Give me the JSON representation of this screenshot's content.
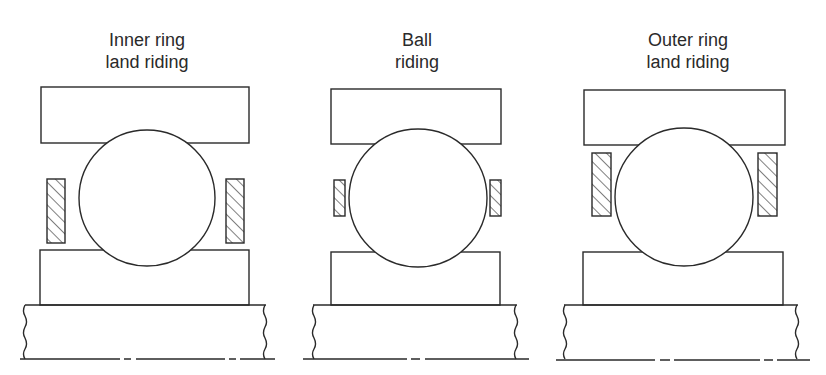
{
  "diagram": {
    "type": "bearing cage guidance comparison",
    "panels": [
      {
        "id": "inner-ring-land-riding",
        "label_line1": "Inner ring",
        "label_line2": "land riding"
      },
      {
        "id": "ball-riding",
        "label_line1": "Ball",
        "label_line2": "riding"
      },
      {
        "id": "outer-ring-land-riding",
        "label_line1": "Outer ring",
        "label_line2": "land riding"
      }
    ],
    "colors": {
      "stroke": "#2a2a2a",
      "background": "#ffffff"
    }
  }
}
